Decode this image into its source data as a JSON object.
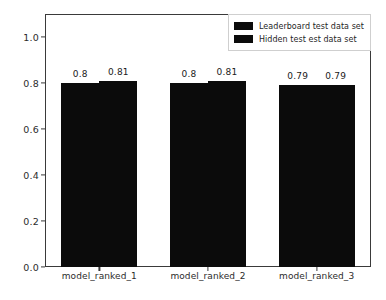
{
  "chart_data": {
    "type": "bar",
    "title": "",
    "xlabel": "",
    "ylabel": "Accuracy scores",
    "categories": [
      "model_ranked_1",
      "model_ranked_2",
      "model_ranked_3"
    ],
    "series": [
      {
        "name": "Leaderboard test data set",
        "values": [
          0.8,
          0.8,
          0.79
        ],
        "labels": [
          "0.8",
          "0.8",
          "0.79"
        ],
        "color": "#0b0b0b"
      },
      {
        "name": "Hidden test est data set",
        "values": [
          0.81,
          0.81,
          0.79
        ],
        "labels": [
          "0.81",
          "0.81",
          "0.79"
        ],
        "color": "#0b0b0b"
      }
    ],
    "ylim": [
      0.0,
      1.1
    ],
    "yticks": [
      0.0,
      0.2,
      0.4,
      0.6,
      0.8,
      1.0
    ],
    "ytick_labels": [
      "0.0",
      "0.2",
      "0.4",
      "0.6",
      "0.8",
      "1.0"
    ],
    "grid": false,
    "legend_position": "upper right"
  },
  "legend": {
    "entries": [
      {
        "label": "Leaderboard test data set"
      },
      {
        "label": "Hidden test est data set"
      }
    ]
  },
  "axes": {
    "y_label": "Accuracy scores"
  }
}
